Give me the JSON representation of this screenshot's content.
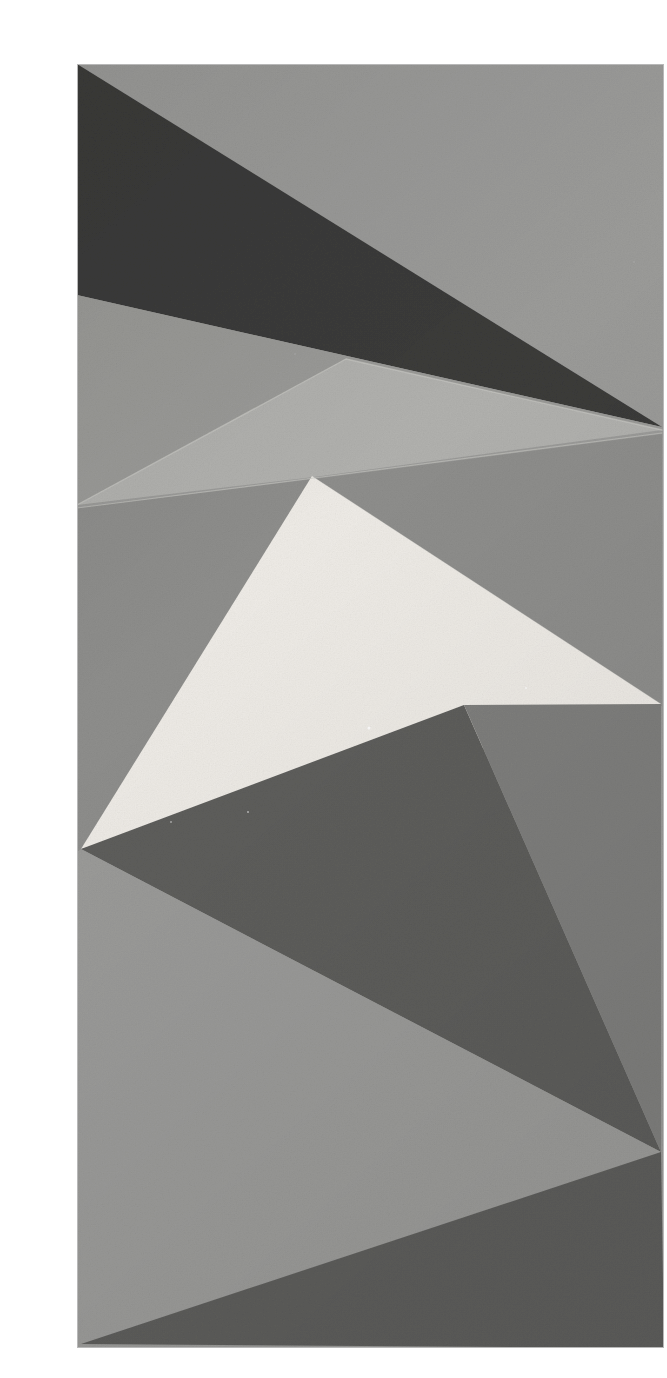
{
  "page": {
    "background_color": "#ffffff",
    "width": 667,
    "height": 1378
  },
  "photo": {
    "name": "folded-paper-photograph",
    "alt_text": "Black and white photograph of a sheet of paper folded into overlapping triangular facets",
    "bounds": {
      "left": 37,
      "top": 48,
      "right": 624,
      "bottom": 1332
    },
    "border_color": "#b8b8b8",
    "grain_opacity": 0.12
  },
  "palette": {
    "paper_white": "#ffffff",
    "facet_highlight": "#eeebe6",
    "facet_light": "#b1b1ae",
    "facet_mid": "#9b9b99",
    "facet_mid_warm": "#9a9a97",
    "facet_mid_dark": "#8e8e8c",
    "facet_shadow": "#7f7f7d",
    "facet_dark": "#5e5e5c",
    "facet_darkest": "#3b3b3a",
    "crease_line": "#c6c6c2"
  },
  "facets": [
    {
      "id": "facet-background-field",
      "label": "Background field",
      "fill_key": "facet_mid",
      "points": "37,48 624,48 624,1332 37,1332"
    },
    {
      "id": "facet-top-dark-wedge",
      "label": "Top dark wedge",
      "fill_key": "facet_darkest",
      "points": "37,48 622,411 37,279"
    },
    {
      "id": "facet-upper-left-panel",
      "label": "Upper left panel",
      "fill_key": "facet_mid_warm",
      "points": "37,279 622,411 37,490"
    },
    {
      "id": "facet-upper-crease-fold",
      "label": "Upper crease fold",
      "fill_key": "facet_light",
      "points": "306,343 622,414 274,461 37,489"
    },
    {
      "id": "facet-lower-crease-fold",
      "label": "Lower crease fold",
      "fill_key": "facet_mid_dark",
      "points": "37,492 274,463 622,418 622,690 37,836"
    },
    {
      "id": "facet-white-triangle",
      "label": "White highlight triangle",
      "fill_key": "facet_highlight",
      "points": "272,460 621,688 41,833"
    },
    {
      "id": "facet-mid-dark-triangle",
      "label": "Mid dark triangle",
      "fill_key": "facet_dark",
      "points": "41,833 621,1136 424,689"
    },
    {
      "id": "facet-right-shadow-panel",
      "label": "Right shadow panel",
      "fill_key": "facet_shadow",
      "points": "424,689 621,688 621,1136"
    },
    {
      "id": "facet-bottom-left-panel",
      "label": "Bottom left light panel",
      "fill_key": "facet_mid",
      "points": "37,836 41,833 621,1136 41,1328"
    },
    {
      "id": "facet-bottom-dark-band",
      "label": "Bottom dark band",
      "fill_key": "facet_dark",
      "points": "41,1328 621,1136 624,1332"
    }
  ],
  "creases": [
    {
      "id": "crease-upper-ridge",
      "label": "Upper ridge crease",
      "path": "M 37,489 L 306,343 L 622,414",
      "stroke_key": "crease_line",
      "width": 1.4,
      "opacity": 0.75
    },
    {
      "id": "crease-mid-valley",
      "label": "Mid valley crease",
      "path": "M 37,492 L 274,462 L 622,417",
      "stroke_key": "crease_line",
      "width": 1.2,
      "opacity": 0.6
    },
    {
      "id": "crease-white-edge",
      "label": "White triangle top edge",
      "path": "M 272,460 L 621,688",
      "stroke_key": "crease_line",
      "width": 0.8,
      "opacity": 0.3
    }
  ],
  "speckles": [
    {
      "id": "speck-1",
      "x": 329,
      "y": 712,
      "r": 1.6,
      "fill": "#ffffff",
      "opacity": 0.85
    },
    {
      "id": "speck-2",
      "x": 486,
      "y": 672,
      "r": 1.1,
      "fill": "#ffffff",
      "opacity": 0.7
    },
    {
      "id": "speck-3",
      "x": 208,
      "y": 796,
      "r": 1.0,
      "fill": "#ffffff",
      "opacity": 0.55
    },
    {
      "id": "speck-4",
      "x": 131,
      "y": 806,
      "r": 0.9,
      "fill": "#ffffff",
      "opacity": 0.5
    },
    {
      "id": "speck-5",
      "x": 255,
      "y": 338,
      "r": 1.0,
      "fill": "#b4b4b2",
      "opacity": 0.45
    },
    {
      "id": "speck-6",
      "x": 594,
      "y": 246,
      "r": 1.0,
      "fill": "#b4b4b2",
      "opacity": 0.4
    }
  ]
}
